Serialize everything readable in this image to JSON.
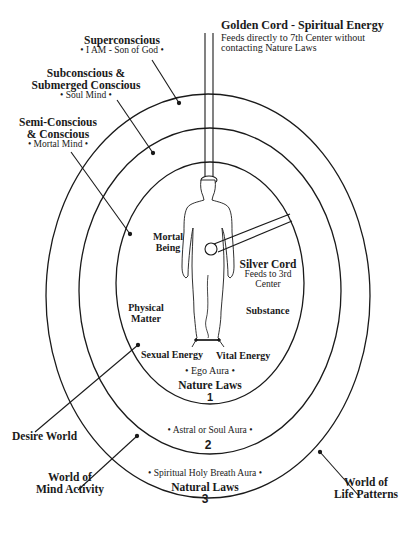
{
  "golden_cord": {
    "title": "Golden Cord - Spiritual Energy",
    "desc_line1": "Feeds directly to 7th Center without",
    "desc_line2": "contacting Nature Laws"
  },
  "superconscious": {
    "title": "Superconscious",
    "sub": "• I AM - Son of God •"
  },
  "subconscious": {
    "title_line1": "Subconscious &",
    "title_line2": "Submerged Conscious",
    "sub": "• Soul Mind •"
  },
  "semiconscious": {
    "title_line1": "Semi-Conscious",
    "title_line2": "& Conscious",
    "sub": "• Mortal Mind •"
  },
  "inner": {
    "mortal_being_line1": "Mortal",
    "mortal_being_line2": "Being",
    "silver_cord_title": "Silver Cord",
    "silver_cord_line1": "Feeds to 3rd",
    "silver_cord_line2": "Center",
    "physical_matter_line1": "Physical",
    "physical_matter_line2": "Matter",
    "substance": "Substance",
    "sexual_energy": "Sexual Energy",
    "vital_energy": "Vital Energy",
    "aura": "• Ego Aura •",
    "laws": "Nature Laws",
    "number": "1"
  },
  "middle": {
    "aura": "• Astral or Soul Aura •",
    "number": "2"
  },
  "outer": {
    "aura": "• Spiritual Holy Breath Aura •",
    "laws": "Natural Laws",
    "number": "3"
  },
  "worlds": {
    "desire": "Desire World",
    "mind_line1": "World of",
    "mind_line2": "Mind Activity",
    "life_line1": "World of",
    "life_line2": "Life Patterns"
  },
  "colors": {
    "ink": "#1a1a1a",
    "background": "#ffffff"
  }
}
